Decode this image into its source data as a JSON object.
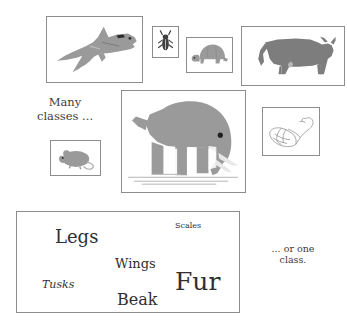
{
  "figure": {
    "background_color": "#ffffff",
    "border_color": "#8d8d8d"
  },
  "captions": {
    "many_classes": "Many\nclasses ...",
    "one_class": "... or one\nclass."
  },
  "animal_boxes": [
    {
      "id": "shark",
      "label": "shark-silhouette",
      "fill": "#9a9a9a",
      "style": "filled"
    },
    {
      "id": "beetle",
      "label": "beetle-silhouette",
      "fill": "#3f3f3f",
      "style": "filled"
    },
    {
      "id": "turtle",
      "label": "turtle-silhouette",
      "fill": "#9a9a9a",
      "style": "filled"
    },
    {
      "id": "cow",
      "label": "cow-silhouette",
      "fill": "#7d7d7d",
      "style": "filled"
    },
    {
      "id": "elephant",
      "label": "elephant-silhouette",
      "fill": "#9a9a9a",
      "style": "filled"
    },
    {
      "id": "mouse",
      "label": "mouse-silhouette",
      "fill": "#9a9a9a",
      "style": "filled"
    },
    {
      "id": "swan",
      "label": "swan-line-drawing",
      "fill": "#ffffff",
      "style": "outline"
    }
  ],
  "features": {
    "legs": "Legs",
    "scales": "Scales",
    "wings": "Wings",
    "fur": "Fur",
    "tusks": "Tusks",
    "beak": "Beak"
  },
  "colors": {
    "silhouette_light": "#9a9a9a",
    "silhouette_dark": "#7d7d7d",
    "beetle": "#3f3f3f",
    "text": "#2f2f2f",
    "border": "#8d8d8d"
  }
}
